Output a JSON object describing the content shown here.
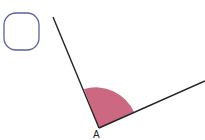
{
  "diagram": {
    "vertex_label": "A",
    "colors": {
      "ray": "#222222",
      "angle_fill": "#c9607a",
      "shape_stroke": "#5a6496"
    },
    "shapes": [
      {
        "type": "rounded-square",
        "name": "rounded-square-shape"
      }
    ],
    "angle": {
      "vertex": "A",
      "description": "obtuse angle between two rays with shaded sector"
    }
  }
}
